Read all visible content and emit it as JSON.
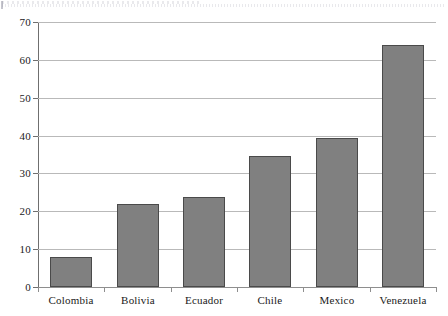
{
  "chart_data": {
    "type": "bar",
    "title": "",
    "subtitle": "",
    "xlabel": "",
    "ylabel": "",
    "categories": [
      "Colombia",
      "Bolivia",
      "Ecuador",
      "Chile",
      "Mexico",
      "Venezuela"
    ],
    "values": [
      8,
      22,
      23.7,
      34.5,
      39.4,
      64
    ],
    "ylim": [
      0,
      70
    ],
    "ytick_step": 10,
    "ytick_labels": [
      "0",
      "10",
      "20",
      "30",
      "40",
      "50",
      "60",
      "70"
    ],
    "ytick_values": [
      0,
      10,
      20,
      30,
      40,
      50,
      60,
      70
    ],
    "grid": "horizontal",
    "legend": "none",
    "bar_color": "#808080",
    "bar_edge_color": "#4a4a4a",
    "gridline_color": "#b9b9b9",
    "axis_color": "#6f6f6f",
    "background_color": "#ffffff",
    "annotations": []
  },
  "figure": {
    "artifact_label": "scan-artifact-top-edge"
  }
}
